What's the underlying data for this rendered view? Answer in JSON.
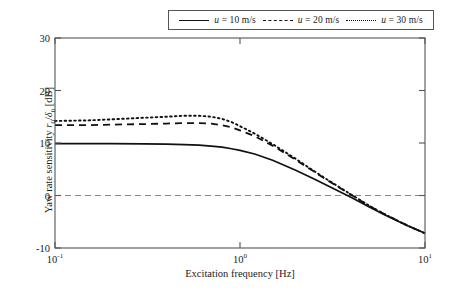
{
  "chart_data": {
    "type": "line",
    "title": "",
    "xlabel": "Excitation frequency [Hz]",
    "ylabel": "Yaw rate sensitivity r0/δ0 [dB]",
    "ylabel_parts": {
      "prefix": "Yaw rate sensitivity ",
      "symbol_num": "r",
      "symbol_num_sub": "0",
      "slash": "/",
      "symbol_den": "δ",
      "symbol_den_sub": "0",
      "suffix": " [dB]"
    },
    "xscale": "log",
    "yscale": "linear",
    "xlim": [
      0.1,
      10
    ],
    "ylim": [
      -10,
      30
    ],
    "yticks": [
      -10,
      0,
      10,
      20,
      30
    ],
    "ytick_labels": [
      "-10",
      "0",
      "10",
      "20",
      "30"
    ],
    "xticks": [
      0.1,
      1,
      10
    ],
    "xtick_labels": [
      "10⁻¹",
      "10⁰",
      "10¹"
    ],
    "xtick_mantissas": [
      "10",
      "10",
      "10"
    ],
    "xtick_exponents": [
      "-1",
      "0",
      "1"
    ],
    "grid": false,
    "legend_position": "top-center-outside",
    "reference_lines": [
      {
        "name": "zero-db-line",
        "axis": "y",
        "value": 0,
        "style": "dashed",
        "color": "#888888"
      }
    ],
    "series": [
      {
        "name": "u = 10 m/s",
        "speed": 10,
        "style": "solid",
        "color": "#111111",
        "x": [
          0.1,
          0.15,
          0.2,
          0.3,
          0.4,
          0.5,
          0.6,
          0.7,
          0.8,
          0.9,
          1.0,
          1.2,
          1.5,
          2.0,
          2.5,
          3.0,
          4.0,
          5.0,
          6.0,
          8.0,
          10.0
        ],
        "y": [
          9.9,
          9.9,
          9.9,
          9.85,
          9.8,
          9.7,
          9.6,
          9.4,
          9.2,
          8.9,
          8.6,
          7.9,
          6.7,
          4.8,
          3.2,
          1.8,
          -0.4,
          -2.2,
          -3.6,
          -5.7,
          -7.2
        ]
      },
      {
        "name": "u = 20 m/s",
        "speed": 20,
        "style": "dashed",
        "color": "#111111",
        "x": [
          0.1,
          0.15,
          0.2,
          0.3,
          0.4,
          0.5,
          0.6,
          0.7,
          0.8,
          0.9,
          1.0,
          1.2,
          1.5,
          2.0,
          2.5,
          3.0,
          4.0,
          5.0,
          6.0,
          8.0,
          10.0
        ],
        "y": [
          13.4,
          13.4,
          13.5,
          13.6,
          13.7,
          13.8,
          13.8,
          13.7,
          13.4,
          13.0,
          12.4,
          11.3,
          9.5,
          6.8,
          4.6,
          2.8,
          0.1,
          -2.0,
          -3.5,
          -5.7,
          -7.2
        ]
      },
      {
        "name": "u = 30 m/s",
        "speed": 30,
        "style": "dotted",
        "color": "#111111",
        "x": [
          0.1,
          0.15,
          0.2,
          0.3,
          0.4,
          0.5,
          0.6,
          0.7,
          0.8,
          0.9,
          1.0,
          1.2,
          1.5,
          2.0,
          2.5,
          3.0,
          4.0,
          5.0,
          6.0,
          8.0,
          10.0
        ],
        "y": [
          14.2,
          14.3,
          14.5,
          14.8,
          15.0,
          15.2,
          15.2,
          15.0,
          14.6,
          14.0,
          13.2,
          11.8,
          9.8,
          7.0,
          4.7,
          2.9,
          0.15,
          -1.95,
          -3.5,
          -5.7,
          -7.2
        ]
      }
    ],
    "annotations": []
  },
  "legend": {
    "entries": [
      {
        "sample": "solid-line-sample",
        "symbol": "u",
        "text": " = 10 m/s"
      },
      {
        "sample": "dashed-line-sample",
        "symbol": "u",
        "text": " = 20 m/s"
      },
      {
        "sample": "dotted-line-sample",
        "symbol": "u",
        "text": " = 30 m/s"
      }
    ]
  },
  "colors": {
    "axis": "#555555",
    "curve": "#111111",
    "reference": "#888888",
    "background": "#ffffff"
  }
}
